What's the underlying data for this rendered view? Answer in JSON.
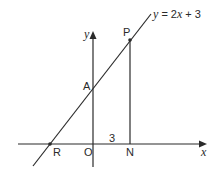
{
  "diagram": {
    "type": "coordinate-geometry",
    "line_equation": "y = 2x + 3",
    "equation_parts": {
      "lhs": "y",
      "eq": " = 2",
      "var": "x",
      "rhs": " + 3"
    },
    "axes": {
      "x_label": "x",
      "y_label": "y"
    },
    "points": {
      "A": "A",
      "P": "P",
      "R": "R",
      "O": "O",
      "N": "N"
    },
    "segment_label_ON": "3",
    "colors": {
      "ink": "#2a2a2a",
      "background": "#ffffff"
    }
  }
}
